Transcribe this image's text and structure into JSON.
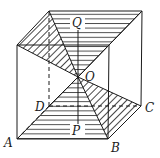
{
  "diagram": {
    "type": "geometry-cube-with-pyramids",
    "colors": {
      "stroke": "#1a1a1a",
      "background": "#ffffff"
    },
    "vertices": {
      "A": {
        "label": "A",
        "x": 17,
        "y": 139
      },
      "B": {
        "label": "B",
        "x": 108,
        "y": 139
      },
      "C": {
        "label": "C",
        "x": 141,
        "y": 106
      },
      "D": {
        "label": "D",
        "x": 49,
        "y": 106
      },
      "A1": {
        "x": 17,
        "y": 45
      },
      "B1": {
        "x": 109,
        "y": 45
      },
      "C1": {
        "x": 142,
        "y": 11
      },
      "D1": {
        "x": 49,
        "y": 11
      },
      "O": {
        "label": "O",
        "x": 78,
        "y": 77
      },
      "P": {
        "label": "P",
        "x": 78,
        "y": 123
      },
      "Q": {
        "label": "Q",
        "x": 78,
        "y": 28
      }
    },
    "labels": {
      "A": "A",
      "B": "B",
      "C": "C",
      "D": "D",
      "O": "O",
      "P": "P",
      "Q": "Q"
    }
  }
}
